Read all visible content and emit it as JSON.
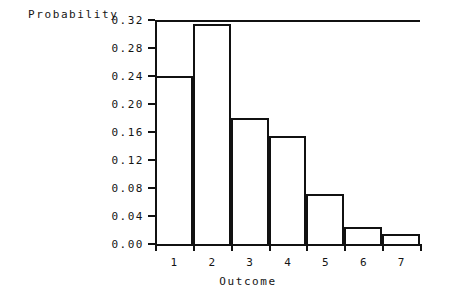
{
  "chart_data": {
    "type": "bar",
    "title": "",
    "xlabel": "Outcome",
    "ylabel": "Probability",
    "categories": [
      "1",
      "2",
      "3",
      "4",
      "5",
      "6",
      "7"
    ],
    "values": [
      0.24,
      0.315,
      0.18,
      0.155,
      0.072,
      0.025,
      0.014
    ],
    "ylim": [
      0.0,
      0.32
    ],
    "yticks": [
      "0.00",
      "0.04",
      "0.08",
      "0.12",
      "0.16",
      "0.20",
      "0.24",
      "0.28",
      "0.32"
    ],
    "ytick_values": [
      0.0,
      0.04,
      0.08,
      0.12,
      0.16,
      0.2,
      0.24,
      0.28,
      0.32
    ],
    "xlim": [
      0.5,
      7.5
    ],
    "grid": false,
    "legend": null,
    "bar_style": {
      "fill": "#ffffff",
      "edge": "#111111"
    }
  },
  "figure": {
    "background": "#ffffff"
  }
}
